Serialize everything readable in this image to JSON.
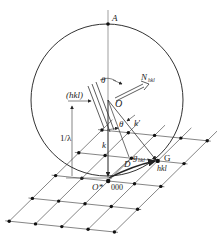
{
  "figure": {
    "labels": {
      "A": "A",
      "theta_top": "θ",
      "N_hkl": "N",
      "N_hkl_sub": "hkl",
      "planes": "(hkl)",
      "O": "O",
      "k_prime": "k′",
      "theta_mid": "θ",
      "inv_lambda": "1/λ",
      "k": "k",
      "g": "g",
      "g_sub": "hkl",
      "D": "D",
      "G": "G",
      "hkl": "hkl",
      "O_star": "O*",
      "origin_index": "000"
    },
    "lattice": {
      "rows": 5,
      "cols": 5,
      "origin_node": "000",
      "reflecting_node": "hkl"
    },
    "colors": {
      "line": "#333333",
      "dot": "#111111"
    }
  }
}
